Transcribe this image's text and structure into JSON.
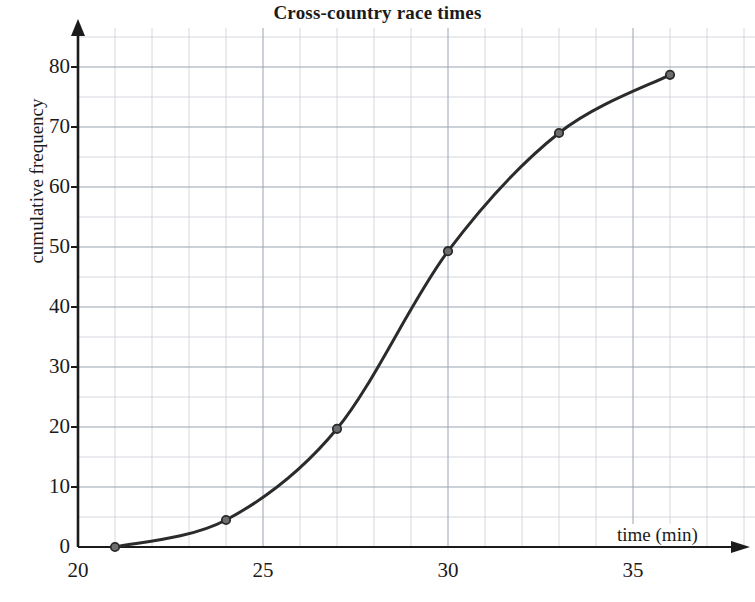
{
  "chart_data": {
    "type": "line",
    "title": "Cross-country race times",
    "xlabel": "time (min)",
    "ylabel": "cumulative frequency",
    "x": [
      21,
      24,
      27,
      30,
      33,
      36
    ],
    "values": [
      0,
      4.5,
      19.7,
      49.3,
      69,
      78.7
    ],
    "series": [
      {
        "name": "cumulative frequency",
        "values": [
          0,
          4.5,
          19.7,
          49.3,
          69,
          78.7
        ]
      }
    ],
    "points": [
      {
        "x": 21,
        "y": 0
      },
      {
        "x": 24,
        "y": 4.5
      },
      {
        "x": 27,
        "y": 19.7
      },
      {
        "x": 30,
        "y": 49.3
      },
      {
        "x": 33,
        "y": 69
      },
      {
        "x": 36,
        "y": 78.7
      }
    ],
    "xlim": [
      20,
      38
    ],
    "ylim": [
      0,
      85
    ],
    "x_tick_labels": [
      "20",
      "25",
      "30",
      "35"
    ],
    "x_tick_values": [
      20,
      25,
      30,
      35
    ],
    "y_tick_labels": [
      "0",
      "10",
      "20",
      "30",
      "40",
      "50",
      "60",
      "70",
      "80"
    ],
    "y_tick_values": [
      0,
      10,
      20,
      30,
      40,
      50,
      60,
      70,
      80
    ],
    "grid": true,
    "grid_major_step_x": 5,
    "grid_minor_step_x": 1,
    "grid_major_step_y": 10,
    "grid_minor_step_y": 5,
    "legend": "none",
    "line_color": "#2b2b2b",
    "marker_color": "#6d6d6d",
    "marker_edge_color": "#2b2b2b",
    "grid_major_color": "#9aa3b0",
    "grid_minor_color": "#c9ced8",
    "axis_color": "#1b1b1b",
    "background_color": "#ffffff"
  }
}
